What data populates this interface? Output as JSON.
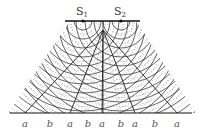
{
  "diagram": {
    "sources": [
      {
        "label": "S",
        "subscript": "1"
      },
      {
        "label": "S",
        "subscript": "2"
      }
    ],
    "bottom_labels": [
      "a",
      "b",
      "a",
      "b",
      "a",
      "b",
      "a",
      "b",
      "a"
    ],
    "colors": {
      "ink": "#222222",
      "background": "#ffffff"
    }
  }
}
